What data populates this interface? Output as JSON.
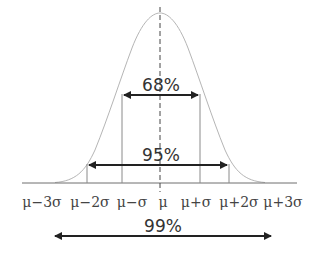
{
  "diagram": {
    "colors": {
      "curve": "#b5b5b5",
      "axis": "#6e6e6e",
      "sigma_lines": "#8a8a8a",
      "arrow": "#222222",
      "text": "#333333"
    },
    "axis_labels": [
      "μ−3σ",
      "μ−2σ",
      "μ−σ",
      "μ",
      "μ+σ",
      "μ+2σ",
      "μ+3σ"
    ],
    "ranges": [
      {
        "label": "68%",
        "from": "μ−σ",
        "to": "μ+σ"
      },
      {
        "label": "95%",
        "from": "μ−2σ",
        "to": "μ+2σ"
      },
      {
        "label": "99%",
        "from": "μ−3σ",
        "to": "μ+3σ"
      }
    ]
  }
}
